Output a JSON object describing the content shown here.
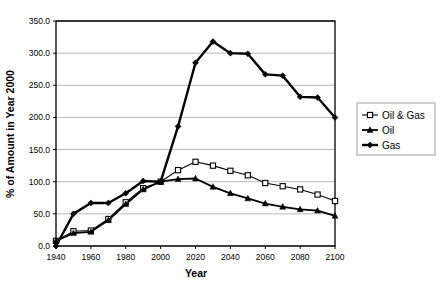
{
  "chart_data": {
    "type": "line",
    "title": "",
    "xlabel": "Year",
    "ylabel": "% of Amount in Year 2000",
    "xlim": [
      1940,
      2100
    ],
    "ylim": [
      0,
      350
    ],
    "ytick_labels": [
      "0.0",
      "50.0",
      "100.0",
      "150.0",
      "200.0",
      "250.0",
      "300.0",
      "350.0"
    ],
    "ytick_values": [
      0,
      50,
      100,
      150,
      200,
      250,
      300,
      350
    ],
    "xtick_labels": [
      "1940",
      "1960",
      "1980",
      "2000",
      "2020",
      "2040",
      "2060",
      "2080",
      "2100"
    ],
    "xtick_values": [
      1940,
      1960,
      1980,
      2000,
      2020,
      2040,
      2060,
      2080,
      2100
    ],
    "grid": "horizontal",
    "legend_position": "right",
    "x": [
      1940,
      1950,
      1960,
      1970,
      1980,
      1990,
      2000,
      2010,
      2020,
      2030,
      2040,
      2050,
      2060,
      2070,
      2080,
      2090,
      2100
    ],
    "series": [
      {
        "name": "Oil & Gas",
        "marker": "open-square",
        "color": "#000000",
        "values": [
          8,
          23,
          24,
          42,
          68,
          90,
          100,
          118,
          131,
          125,
          117,
          110,
          98,
          93,
          88,
          80,
          70
        ]
      },
      {
        "name": "Oil",
        "marker": "filled-triangle",
        "color": "#000000",
        "values": [
          8,
          20,
          22,
          40,
          65,
          88,
          100,
          104,
          105,
          92,
          82,
          74,
          66,
          61,
          57,
          55,
          47
        ]
      },
      {
        "name": "Gas",
        "marker": "filled-diamond",
        "color": "#000000",
        "values": [
          0,
          50,
          67,
          67,
          82,
          101,
          100,
          186,
          285,
          318,
          300,
          299,
          267,
          265,
          232,
          231,
          200
        ]
      }
    ]
  },
  "legend": {
    "items": [
      {
        "label": "Oil & Gas"
      },
      {
        "label": "Oil"
      },
      {
        "label": "Gas"
      }
    ]
  }
}
